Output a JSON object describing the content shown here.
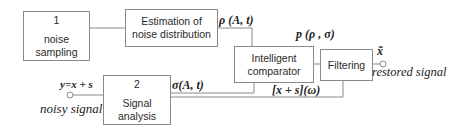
{
  "diagram": {
    "blocks": {
      "noise_sampling": {
        "number": "1",
        "label": "noise sampling"
      },
      "estimation": {
        "line1": "Estimation of",
        "line2": "noise distribution"
      },
      "comparator": {
        "line1": "Intelligent",
        "line2": "comparator"
      },
      "filtering": {
        "label": "Filtering"
      },
      "signal_analysis": {
        "number": "2",
        "label": "Signal analysis"
      }
    },
    "signals": {
      "rho": "ρ (A, t)",
      "p": "p (ρ , σ)",
      "sigma": "σ(A, t)",
      "spectrum": "[x + s](ω)",
      "input_eq": "y=x + s",
      "input_name": "noisy signal",
      "output_symbol": "x̃",
      "output_name": "restored signal"
    },
    "colors": {
      "line": "#8a8a8a",
      "text": "#222222"
    }
  }
}
